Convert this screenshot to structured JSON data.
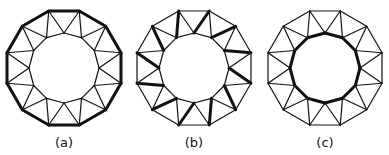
{
  "figure": {
    "n_sides": 12,
    "outer_radius": 59,
    "inner_radius": 35,
    "stroke_color": "#111111",
    "thin_width": 1.2,
    "bold_width": 3,
    "panels": [
      {
        "id": "a",
        "label": "(a)",
        "cx": 64,
        "cy": 68,
        "highlight": "outer"
      },
      {
        "id": "b",
        "label": "(b)",
        "cx": 194,
        "cy": 68,
        "highlight": "spokes_matching"
      },
      {
        "id": "c",
        "label": "(c)",
        "cx": 325,
        "cy": 68,
        "highlight": "inner"
      }
    ]
  }
}
